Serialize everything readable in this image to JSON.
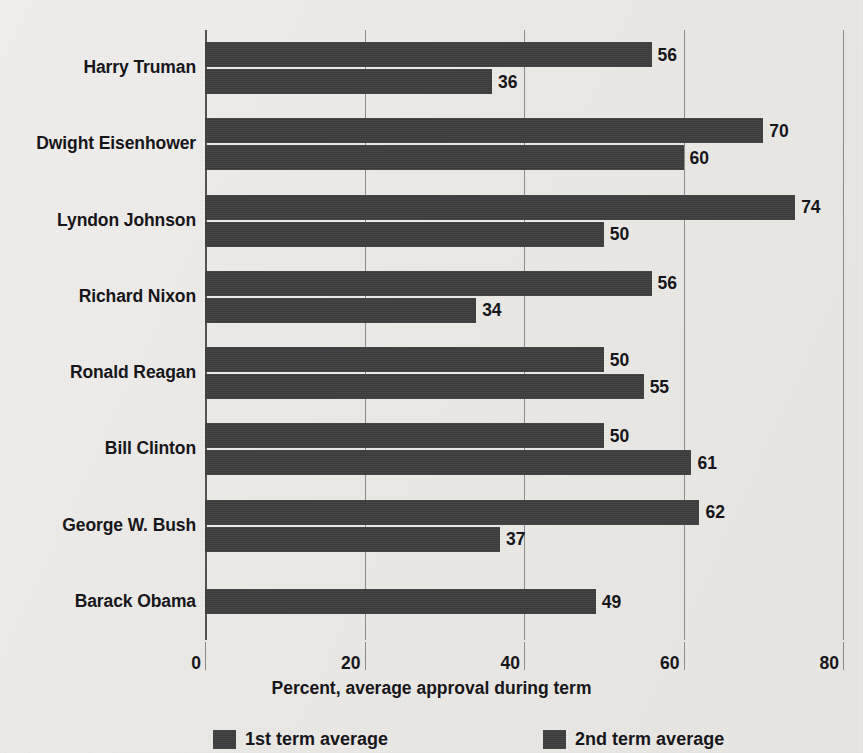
{
  "chart_data": {
    "type": "bar",
    "orientation": "horizontal",
    "title": "",
    "xlabel": "Percent, average approval during term",
    "ylabel": "",
    "xlim": [
      0,
      80
    ],
    "xticks": [
      0,
      20,
      40,
      60,
      80
    ],
    "xtick_labels": [
      "0",
      "20",
      "40",
      "60",
      "80"
    ],
    "grid": true,
    "legend_position": "bottom",
    "categories": [
      "Harry Truman",
      "Dwight Eisenhower",
      "Lyndon Johnson",
      "Richard Nixon",
      "Ronald Reagan",
      "Bill Clinton",
      "George W. Bush",
      "Barack Obama"
    ],
    "series": [
      {
        "name": "1st term average",
        "color": "#3f3e3e",
        "values": [
          56,
          70,
          74,
          56,
          50,
          50,
          62,
          49
        ],
        "labels": [
          "56",
          "70",
          "74",
          "56",
          "50",
          "50",
          "62",
          "49"
        ]
      },
      {
        "name": "2nd term average",
        "color": "#3f3e3e",
        "values": [
          36,
          60,
          50,
          34,
          55,
          61,
          37,
          null
        ],
        "labels": [
          "36",
          "60",
          "50",
          "34",
          "55",
          "61",
          "37",
          ""
        ]
      }
    ]
  },
  "legend": {
    "items": [
      {
        "label": "1st term average"
      },
      {
        "label": "2nd term average"
      }
    ]
  },
  "axis": {
    "x_title": "Percent, average approval during term"
  },
  "colors": {
    "bar": "#3f3e3e",
    "background": "#edebe8",
    "text": "#17161a",
    "gridline": "#8d8b89"
  }
}
